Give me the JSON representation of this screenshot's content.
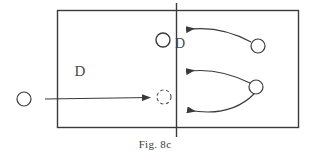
{
  "figure": {
    "caption": "Fig. 8c",
    "title": "Fig. 8c",
    "background_color": "#ffffff",
    "stroke_color": "#3a3a3a",
    "label_color": "#4a4a4a"
  },
  "court": {
    "name": "volleyball-court-rectangle",
    "x": 57,
    "y": 10,
    "width": 242,
    "height": 118,
    "net_line": {
      "name": "center-net-line",
      "x": 176,
      "y_top": 3,
      "y_bottom": 137
    }
  },
  "labels": [
    {
      "id": "d-left",
      "text": "D",
      "x": 80,
      "y": 76
    },
    {
      "id": "d-center",
      "text": "D",
      "x": 175,
      "y": 48
    }
  ],
  "players": [
    {
      "id": "player-left-outside",
      "style": "solid",
      "cx": 24,
      "cy": 99,
      "r": 7
    },
    {
      "id": "player-center-setter",
      "style": "solid",
      "cx": 163,
      "cy": 40,
      "r": 7
    },
    {
      "id": "player-target-dashed",
      "style": "dashed",
      "cx": 164,
      "cy": 97,
      "r": 7
    },
    {
      "id": "player-right-top",
      "style": "solid",
      "cx": 258,
      "cy": 46,
      "r": 7
    },
    {
      "id": "player-right-middle",
      "style": "solid",
      "cx": 256,
      "cy": 87,
      "r": 7
    }
  ],
  "arrows": [
    {
      "id": "arrow-straight-left-to-target",
      "kind": "straight",
      "from": {
        "x": 45,
        "y": 99
      },
      "to": {
        "x": 155,
        "y": 97
      }
    },
    {
      "id": "arrow-curve-top-right-to-net",
      "kind": "curved",
      "from": {
        "x": 251,
        "y": 42
      },
      "control": {
        "x": 220,
        "y": 27
      },
      "to": {
        "x": 181,
        "y": 30
      }
    },
    {
      "id": "arrow-curve-middle-right-to-net-upper",
      "kind": "curved",
      "from": {
        "x": 250,
        "y": 83
      },
      "control": {
        "x": 218,
        "y": 69
      },
      "to": {
        "x": 181,
        "y": 72
      }
    },
    {
      "id": "arrow-curve-middle-right-to-net-lower",
      "kind": "curved",
      "from": {
        "x": 254,
        "y": 94
      },
      "control": {
        "x": 228,
        "y": 117
      },
      "to": {
        "x": 182,
        "y": 110
      }
    }
  ]
}
